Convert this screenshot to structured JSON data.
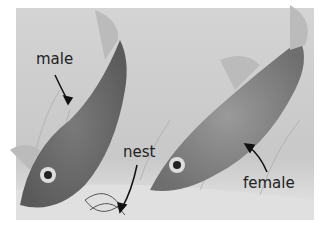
{
  "image": {
    "description": "Grayscale illustration of two stickleback-like fish underwater with a nest of plant material; labels mark male, female, and nest",
    "labels": {
      "male": "male",
      "nest": "nest",
      "female": "female"
    }
  }
}
